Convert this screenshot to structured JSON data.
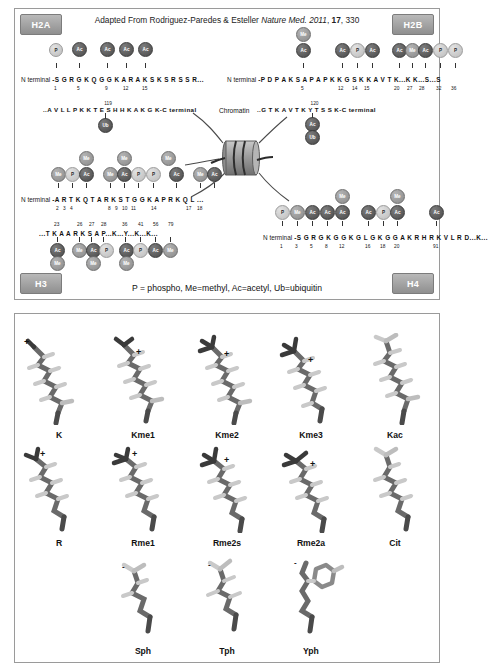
{
  "citation": {
    "prefix": "Adapted From Rodriguez-Paredes & Esteller ",
    "journal": "Nature Med. 2011",
    "volume": "17",
    "page": ", 330",
    "comma": ", "
  },
  "legend": "P = phospho, Me=methyl, Ac=acetyl, Ub=ubiquitin",
  "corner_tabs": {
    "h2a": "H2A",
    "h2b": "H2B",
    "h3": "H3",
    "h4": "H4"
  },
  "chromatin": {
    "label": "Chromatin"
  },
  "labels": {
    "n_terminal": "N terminal",
    "c_terminal": "C terminal"
  },
  "colors": {
    "acetyl": "#4a4a4a",
    "methyl": "#8a8a8a",
    "phospho": "#bcbcbc",
    "ubiquitin": "#474747",
    "tab": "#8f8f8f",
    "border": "#9a9a9a"
  },
  "histones": {
    "h2a": {
      "name": "H2A",
      "n_sequence": "-S G R G K Q G G K A R A K S K S R S S R...",
      "n_numbers": [
        "1",
        "5",
        "9",
        "12",
        "15"
      ],
      "c_sequence": "..A V L L P K K T E S H H K A K G K-",
      "c_number": "119",
      "c_mods": [
        "Ub"
      ],
      "mods": [
        {
          "label": "P",
          "type": "phospho"
        },
        {
          "label": "Ac",
          "type": "acetyl"
        },
        {
          "label": "Ac",
          "type": "acetyl"
        },
        {
          "label": "Ac",
          "type": "acetyl"
        },
        {
          "label": "Ac",
          "type": "acetyl"
        }
      ]
    },
    "h2b": {
      "name": "H2B",
      "n_sequence": "-P D P A K S A P A P K K G S K K A V T K...K K...S...S",
      "n_numbers": [
        "5",
        "12",
        "14",
        "15",
        "20",
        "27",
        "28",
        "32",
        "36"
      ],
      "c_sequence": "..G T K A V T K Y T S S K-",
      "c_number": "120",
      "c_mods": [
        "Ac",
        "Ub"
      ],
      "mods": [
        {
          "label": "Ac",
          "type": "acetyl",
          "stacked": "Me"
        },
        {
          "label": "Ac",
          "type": "acetyl"
        },
        {
          "label": "P",
          "type": "phospho"
        },
        {
          "label": "Ac",
          "type": "acetyl"
        },
        {
          "label": "Ac",
          "type": "acetyl"
        },
        {
          "label": "Me",
          "type": "methyl"
        },
        {
          "label": "Ac",
          "type": "acetyl"
        },
        {
          "label": "P",
          "type": "phospho"
        },
        {
          "label": "P",
          "type": "phospho"
        }
      ]
    },
    "h3": {
      "name": "H3",
      "n_sequence": "-A R T K Q T A R K S T G G K A P R K Q L ...",
      "n_numbers": [
        "2",
        "3",
        "4",
        "8",
        "9",
        "10",
        "11",
        "14",
        "17",
        "18"
      ],
      "c_sequence": "...T K A A R K S A P...K...Y...K...K...",
      "c_numbers": [
        "23",
        "26",
        "27",
        "28",
        "36",
        "41",
        "56",
        "79"
      ],
      "mods": [
        {
          "label": "Me",
          "type": "methyl"
        },
        {
          "label": "P",
          "type": "phospho"
        },
        {
          "label": "Ac",
          "type": "acetyl",
          "stacked": "Me"
        },
        {
          "label": "Me",
          "type": "methyl"
        },
        {
          "label": "Ac",
          "type": "acetyl",
          "stacked": "Me"
        },
        {
          "label": "P",
          "type": "phospho"
        },
        {
          "label": "P",
          "type": "phospho"
        },
        {
          "label": "Ac",
          "type": "acetyl",
          "stacked": "Me"
        },
        {
          "label": "Me",
          "type": "methyl"
        },
        {
          "label": "Ac",
          "type": "acetyl"
        }
      ],
      "c_mods": [
        {
          "label": "Ac",
          "type": "acetyl",
          "stacked": "Me"
        },
        {
          "label": "Me",
          "type": "methyl"
        },
        {
          "label": "Ac",
          "type": "acetyl"
        },
        {
          "label": "P",
          "type": "phospho",
          "stacked": "Me"
        },
        {
          "label": "Ac",
          "type": "acetyl",
          "stacked": "Me"
        },
        {
          "label": "P",
          "type": "phospho"
        },
        {
          "label": "Ac",
          "type": "acetyl"
        },
        {
          "label": "Me",
          "type": "methyl"
        }
      ]
    },
    "h4": {
      "name": "H4",
      "n_sequence": "-S G R G K G G K G L G K G G A K R H R K V L R D...K...",
      "n_numbers": [
        "1",
        "3",
        "5",
        "8",
        "12",
        "16",
        "18",
        "20",
        "91"
      ],
      "mods": [
        {
          "label": "P",
          "type": "phospho"
        },
        {
          "label": "Me",
          "type": "methyl"
        },
        {
          "label": "Ac",
          "type": "acetyl"
        },
        {
          "label": "Ac",
          "type": "acetyl"
        },
        {
          "label": "Ac",
          "type": "acetyl",
          "stacked": "Me"
        },
        {
          "label": "Ac",
          "type": "acetyl"
        },
        {
          "label": "P",
          "type": "phospho"
        },
        {
          "label": "Ac",
          "type": "acetyl",
          "stacked": "Me"
        },
        {
          "label": "Ac",
          "type": "acetyl"
        }
      ]
    }
  },
  "structures": {
    "rows": [
      {
        "cells": [
          {
            "label": "K",
            "charge": "+"
          },
          {
            "label": "Kme1",
            "charge": "+"
          },
          {
            "label": "Kme2",
            "charge": "+"
          },
          {
            "label": "Kme3",
            "charge": "+"
          },
          {
            "label": "Kac",
            "charge": ""
          }
        ]
      },
      {
        "cells": [
          {
            "label": "R",
            "charge": "+"
          },
          {
            "label": "Rme1",
            "charge": "+"
          },
          {
            "label": "Rme2s",
            "charge": "+"
          },
          {
            "label": "Rme2a",
            "charge": "+"
          },
          {
            "label": "Cit",
            "charge": ""
          }
        ]
      },
      {
        "cells": [
          {
            "label": "Sph",
            "charge": "-"
          },
          {
            "label": "Tph",
            "charge": "-"
          },
          {
            "label": "Yph",
            "charge": "-"
          }
        ]
      }
    ]
  }
}
